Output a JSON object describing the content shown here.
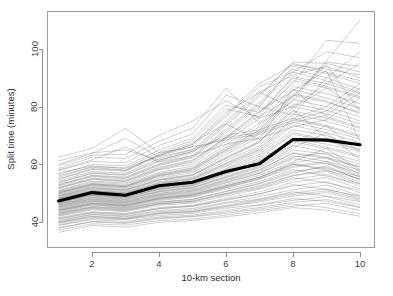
{
  "chart_data": {
    "type": "line",
    "title": "",
    "subtitle": "",
    "xlabel": "10-km section",
    "ylabel": "Split time (minutes)",
    "xlim": [
      1,
      10
    ],
    "ylim": [
      35,
      112
    ],
    "xticks": [
      2,
      4,
      6,
      8,
      10
    ],
    "xtick_labels": [
      "2",
      "4",
      "6",
      "8",
      "10"
    ],
    "yticks": [
      40,
      60,
      80,
      100
    ],
    "ytick_labels": [
      "40",
      "60",
      "80",
      "100"
    ],
    "grid": false,
    "legend": null,
    "legend_position": "none",
    "x": [
      1,
      2,
      3,
      4,
      5,
      6,
      7,
      8,
      9,
      10
    ],
    "series": [
      {
        "name": "mean-split-time",
        "style": "bold-black",
        "values": [
          47.3,
          50.2,
          49.3,
          52.6,
          53.8,
          57.5,
          60.2,
          68.6,
          68.4,
          66.8
        ]
      },
      {
        "name": "runner-1",
        "values": [
          38.1,
          40.0,
          39.5,
          41.1,
          41.8,
          43.0,
          44.5,
          46.2,
          45.0,
          42.8
        ]
      },
      {
        "name": "runner-2",
        "values": [
          39.0,
          41.2,
          40.8,
          42.3,
          43.0,
          44.8,
          46.0,
          48.1,
          47.2,
          45.0
        ]
      },
      {
        "name": "runner-3",
        "values": [
          36.4,
          38.8,
          38.2,
          39.9,
          40.5,
          41.8,
          43.2,
          45.0,
          44.1,
          42.0
        ]
      },
      {
        "name": "runner-4",
        "values": [
          40.2,
          42.5,
          41.8,
          43.6,
          44.2,
          46.5,
          48.0,
          50.5,
          49.0,
          47.1
        ]
      },
      {
        "name": "runner-5",
        "values": [
          41.0,
          43.1,
          42.5,
          44.6,
          45.5,
          47.8,
          49.6,
          53.0,
          51.2,
          49.0
        ]
      },
      {
        "name": "runner-6",
        "values": [
          42.3,
          44.5,
          43.9,
          46.2,
          47.0,
          49.5,
          51.8,
          55.4,
          53.6,
          51.0
        ]
      },
      {
        "name": "runner-7",
        "values": [
          43.5,
          45.8,
          45.0,
          47.5,
          48.6,
          51.4,
          54.0,
          58.2,
          56.0,
          53.2
        ]
      },
      {
        "name": "runner-8",
        "values": [
          44.1,
          46.4,
          45.7,
          48.3,
          49.5,
          52.6,
          55.5,
          60.1,
          58.0,
          55.0
        ]
      },
      {
        "name": "runner-9",
        "values": [
          45.0,
          47.2,
          46.5,
          49.1,
          50.2,
          53.5,
          56.8,
          62.0,
          60.2,
          57.1
        ]
      },
      {
        "name": "runner-10",
        "values": [
          45.8,
          48.0,
          47.3,
          50.0,
          51.3,
          54.8,
          58.2,
          64.0,
          62.5,
          59.2
        ]
      },
      {
        "name": "runner-11",
        "values": [
          46.3,
          48.7,
          48.0,
          50.8,
          52.1,
          55.9,
          59.6,
          66.5,
          64.2,
          61.0
        ]
      },
      {
        "name": "runner-12",
        "values": [
          46.9,
          49.3,
          48.6,
          51.5,
          52.9,
          57.0,
          61.1,
          68.5,
          66.0,
          63.0
        ]
      },
      {
        "name": "runner-13",
        "values": [
          47.4,
          49.9,
          49.2,
          52.2,
          53.6,
          58.2,
          62.8,
          71.0,
          68.5,
          65.2
        ]
      },
      {
        "name": "runner-14",
        "values": [
          47.9,
          50.4,
          49.7,
          52.9,
          54.4,
          59.3,
          64.2,
          73.5,
          71.0,
          67.5
        ]
      },
      {
        "name": "runner-15",
        "values": [
          48.4,
          51.0,
          50.3,
          53.6,
          55.2,
          60.5,
          65.8,
          76.0,
          73.4,
          70.0
        ]
      },
      {
        "name": "runner-16",
        "values": [
          48.9,
          51.6,
          50.9,
          54.4,
          56.1,
          61.9,
          67.5,
          78.5,
          76.0,
          72.5
        ]
      },
      {
        "name": "runner-17",
        "values": [
          49.5,
          52.3,
          51.6,
          55.3,
          57.1,
          63.4,
          69.5,
          81.0,
          78.8,
          75.0
        ]
      },
      {
        "name": "runner-18",
        "values": [
          50.1,
          53.0,
          52.3,
          56.2,
          58.2,
          65.0,
          71.8,
          84.0,
          81.5,
          78.0
        ]
      },
      {
        "name": "runner-19",
        "values": [
          50.8,
          53.8,
          53.1,
          57.2,
          59.4,
          66.8,
          74.2,
          87.0,
          84.5,
          81.0
        ]
      },
      {
        "name": "runner-20",
        "values": [
          51.6,
          54.7,
          54.0,
          58.3,
          60.8,
          68.8,
          77.0,
          90.5,
          88.0,
          84.5
        ]
      },
      {
        "name": "runner-21",
        "values": [
          52.5,
          55.7,
          55.0,
          59.6,
          62.3,
          71.0,
          80.0,
          94.0,
          91.5,
          88.0
        ]
      },
      {
        "name": "runner-22",
        "values": [
          53.5,
          56.8,
          56.2,
          61.0,
          64.0,
          73.5,
          83.5,
          95.5,
          95.0,
          92.0
        ]
      },
      {
        "name": "runner-23",
        "values": [
          54.8,
          58.2,
          57.6,
          62.8,
          66.2,
          76.5,
          87.0,
          92.0,
          99.0,
          97.0
        ]
      },
      {
        "name": "runner-24",
        "values": [
          56.5,
          60.0,
          59.5,
          65.0,
          69.0,
          80.5,
          78.0,
          88.0,
          103.0,
          102.0
        ]
      },
      {
        "name": "runner-25",
        "values": [
          58.5,
          62.5,
          62.0,
          68.0,
          72.5,
          86.5,
          74.0,
          82.0,
          96.0,
          110.0
        ]
      },
      {
        "name": "runner-26",
        "values": [
          61.2,
          64.0,
          65.0,
          61.5,
          64.5,
          70.0,
          72.0,
          76.0,
          80.0,
          88.0
        ]
      },
      {
        "name": "runner-27",
        "values": [
          62.5,
          65.5,
          72.5,
          64.0,
          66.0,
          68.5,
          70.5,
          74.5,
          77.0,
          85.0
        ]
      },
      {
        "name": "runner-28",
        "values": [
          57.0,
          59.5,
          58.5,
          63.0,
          67.0,
          78.0,
          85.0,
          79.5,
          86.5,
          79.0
        ]
      },
      {
        "name": "runner-29",
        "values": [
          55.5,
          59.0,
          58.0,
          63.5,
          67.5,
          74.0,
          68.5,
          86.0,
          76.5,
          73.0
        ]
      },
      {
        "name": "runner-30",
        "values": [
          52.0,
          55.2,
          54.5,
          59.0,
          61.5,
          69.5,
          78.5,
          85.5,
          92.5,
          68.0
        ]
      },
      {
        "name": "runner-31",
        "values": [
          49.2,
          52.0,
          51.2,
          54.8,
          56.5,
          62.5,
          68.0,
          79.0,
          69.0,
          66.5
        ]
      },
      {
        "name": "runner-32",
        "values": [
          46.6,
          49.0,
          48.3,
          51.2,
          52.5,
          56.5,
          60.3,
          67.0,
          73.5,
          64.0
        ]
      },
      {
        "name": "runner-33",
        "values": [
          44.8,
          47.0,
          46.2,
          48.8,
          49.9,
          53.0,
          56.2,
          61.0,
          65.5,
          58.0
        ]
      },
      {
        "name": "runner-34",
        "values": [
          43.0,
          45.2,
          44.6,
          46.8,
          47.8,
          50.5,
          53.2,
          57.0,
          59.5,
          54.5
        ]
      },
      {
        "name": "runner-35",
        "values": [
          41.5,
          43.6,
          43.0,
          45.0,
          45.8,
          48.2,
          50.5,
          53.8,
          55.5,
          51.5
        ]
      },
      {
        "name": "runner-36",
        "values": [
          40.0,
          42.0,
          41.4,
          43.2,
          43.8,
          45.8,
          47.8,
          50.0,
          51.5,
          48.5
        ]
      },
      {
        "name": "runner-37",
        "values": [
          38.8,
          40.8,
          40.2,
          41.8,
          42.4,
          44.0,
          45.8,
          47.5,
          48.8,
          46.0
        ]
      },
      {
        "name": "runner-38",
        "values": [
          37.2,
          39.4,
          38.9,
          40.5,
          41.0,
          42.4,
          43.9,
          45.5,
          46.5,
          44.0
        ]
      },
      {
        "name": "runner-39",
        "values": [
          47.0,
          49.5,
          48.8,
          51.8,
          53.2,
          57.2,
          61.5,
          69.0,
          67.0,
          64.5
        ]
      },
      {
        "name": "runner-40",
        "values": [
          48.1,
          50.7,
          50.0,
          53.2,
          54.8,
          59.8,
          64.8,
          74.5,
          72.0,
          68.8
        ]
      },
      {
        "name": "runner-41",
        "values": [
          45.4,
          47.6,
          46.9,
          49.5,
          50.8,
          54.2,
          57.5,
          63.0,
          61.0,
          58.0
        ]
      },
      {
        "name": "runner-42",
        "values": [
          50.5,
          53.4,
          52.7,
          56.8,
          58.8,
          65.9,
          73.0,
          86.0,
          83.0,
          79.5
        ]
      },
      {
        "name": "runner-43",
        "values": [
          42.8,
          45.0,
          44.3,
          46.5,
          47.4,
          50.0,
          52.6,
          56.2,
          58.0,
          53.8
        ]
      },
      {
        "name": "runner-44",
        "values": [
          51.0,
          54.2,
          53.5,
          58.0,
          60.2,
          68.0,
          76.0,
          89.0,
          86.5,
          83.0
        ]
      },
      {
        "name": "runner-45",
        "values": [
          44.5,
          46.7,
          46.0,
          48.5,
          49.6,
          52.5,
          55.6,
          60.5,
          62.5,
          56.5
        ]
      },
      {
        "name": "runner-46",
        "values": [
          53.0,
          56.2,
          55.6,
          60.2,
          63.0,
          72.2,
          81.5,
          93.0,
          90.0,
          86.0
        ]
      },
      {
        "name": "runner-47",
        "values": [
          46.0,
          48.3,
          47.6,
          50.4,
          51.7,
          55.3,
          58.8,
          65.0,
          63.5,
          60.0
        ]
      },
      {
        "name": "runner-48",
        "values": [
          49.8,
          52.6,
          51.9,
          55.8,
          57.6,
          64.2,
          70.5,
          82.5,
          80.0,
          76.5
        ]
      },
      {
        "name": "runner-49",
        "values": [
          43.8,
          46.0,
          45.3,
          47.8,
          48.9,
          51.8,
          54.8,
          59.0,
          60.5,
          55.5
        ]
      },
      {
        "name": "runner-50",
        "values": [
          54.2,
          57.5,
          56.9,
          62.0,
          65.0,
          75.0,
          85.0,
          91.0,
          94.0,
          90.0
        ]
      },
      {
        "name": "runner-51",
        "values": [
          39.5,
          41.6,
          41.0,
          42.8,
          43.4,
          45.2,
          47.0,
          49.0,
          50.2,
          47.5
        ]
      },
      {
        "name": "runner-52",
        "values": [
          59.5,
          63.2,
          63.5,
          70.0,
          75.0,
          82.0,
          76.0,
          80.0,
          88.0,
          95.0
        ]
      },
      {
        "name": "runner-53",
        "values": [
          57.8,
          61.0,
          60.5,
          66.5,
          70.5,
          84.0,
          80.0,
          77.0,
          90.0,
          99.0
        ]
      },
      {
        "name": "runner-54",
        "values": [
          60.0,
          63.8,
          69.0,
          62.5,
          65.2,
          69.2,
          71.2,
          75.2,
          78.5,
          86.5
        ]
      },
      {
        "name": "runner-55",
        "values": [
          47.6,
          50.1,
          49.4,
          52.4,
          53.9,
          58.6,
          63.5,
          72.0,
          70.0,
          66.0
        ]
      },
      {
        "name": "runner-56",
        "values": [
          45.6,
          47.9,
          47.1,
          49.8,
          51.0,
          54.5,
          58.0,
          63.8,
          62.0,
          59.0
        ]
      },
      {
        "name": "runner-57",
        "values": [
          42.0,
          44.2,
          43.6,
          45.8,
          46.6,
          49.0,
          51.4,
          54.8,
          56.5,
          52.5
        ]
      },
      {
        "name": "runner-58",
        "values": [
          50.3,
          53.2,
          52.5,
          56.5,
          58.5,
          65.5,
          72.0,
          84.5,
          82.0,
          77.5
        ]
      },
      {
        "name": "runner-59",
        "values": [
          48.7,
          51.3,
          50.6,
          54.0,
          55.6,
          61.2,
          66.5,
          77.5,
          75.0,
          71.5
        ]
      },
      {
        "name": "runner-60",
        "values": [
          44.0,
          46.2,
          45.5,
          48.0,
          49.1,
          52.0,
          55.0,
          59.5,
          61.0,
          56.0
        ]
      },
      {
        "name": "runner-61",
        "values": [
          52.8,
          56.0,
          55.3,
          59.9,
          62.6,
          71.6,
          80.8,
          92.0,
          89.0,
          85.0
        ]
      },
      {
        "name": "runner-62",
        "values": [
          46.8,
          49.2,
          48.5,
          51.4,
          52.7,
          56.8,
          60.8,
          67.8,
          65.5,
          62.5
        ]
      },
      {
        "name": "runner-63",
        "values": [
          41.2,
          43.3,
          42.7,
          44.7,
          45.4,
          47.5,
          49.8,
          52.5,
          54.0,
          50.2
        ]
      },
      {
        "name": "runner-64",
        "values": [
          55.0,
          58.5,
          57.9,
          63.2,
          66.8,
          77.2,
          88.0,
          94.5,
          93.0,
          91.0
        ]
      },
      {
        "name": "runner-65",
        "values": [
          49.0,
          51.8,
          51.1,
          54.6,
          56.3,
          62.2,
          67.8,
          80.0,
          77.5,
          74.0
        ]
      },
      {
        "name": "runner-66",
        "values": [
          43.2,
          45.4,
          44.8,
          47.0,
          47.9,
          50.7,
          53.5,
          57.5,
          59.0,
          54.8
        ]
      },
      {
        "name": "runner-67",
        "values": [
          51.8,
          54.9,
          54.2,
          58.6,
          61.2,
          69.2,
          78.0,
          90.0,
          87.0,
          83.5
        ]
      },
      {
        "name": "runner-68",
        "values": [
          47.2,
          49.7,
          49.0,
          52.0,
          53.4,
          57.8,
          62.0,
          70.5,
          68.0,
          65.0
        ]
      },
      {
        "name": "runner-69",
        "values": [
          40.6,
          42.7,
          42.1,
          44.0,
          44.7,
          46.8,
          48.8,
          51.2,
          52.8,
          49.2
        ]
      },
      {
        "name": "runner-70",
        "values": [
          56.0,
          59.2,
          58.8,
          64.2,
          68.2,
          79.2,
          76.5,
          83.5,
          95.5,
          94.0
        ]
      },
      {
        "name": "runner-71",
        "values": [
          48.2,
          50.8,
          50.1,
          53.4,
          55.0,
          60.2,
          65.2,
          75.5,
          73.0,
          69.5
        ]
      },
      {
        "name": "runner-72",
        "values": [
          45.2,
          47.4,
          46.7,
          49.3,
          50.5,
          53.8,
          57.0,
          62.5,
          64.0,
          57.5
        ]
      },
      {
        "name": "runner-73",
        "values": [
          42.5,
          44.8,
          44.1,
          46.3,
          47.2,
          49.8,
          52.2,
          56.0,
          57.5,
          53.2
        ]
      },
      {
        "name": "runner-74",
        "values": [
          53.8,
          57.0,
          56.5,
          61.4,
          64.5,
          74.2,
          84.2,
          95.0,
          92.0,
          89.0
        ]
      },
      {
        "name": "runner-75",
        "values": [
          46.2,
          48.5,
          47.8,
          50.6,
          51.9,
          55.6,
          59.2,
          65.8,
          71.0,
          61.5
        ]
      },
      {
        "name": "runner-76",
        "values": [
          39.8,
          41.9,
          41.2,
          43.0,
          43.6,
          45.5,
          47.4,
          49.5,
          50.8,
          48.0
        ]
      },
      {
        "name": "runner-77",
        "values": [
          50.0,
          52.9,
          52.2,
          56.0,
          58.0,
          64.8,
          71.0,
          83.5,
          94.5,
          78.5
        ]
      },
      {
        "name": "runner-78",
        "values": [
          44.3,
          46.5,
          45.8,
          48.2,
          49.3,
          52.2,
          55.3,
          60.0,
          58.5,
          55.8
        ]
      },
      {
        "name": "runner-79",
        "values": [
          58.0,
          61.5,
          66.0,
          60.8,
          63.0,
          67.0,
          69.0,
          73.0,
          75.5,
          83.0
        ]
      },
      {
        "name": "runner-80",
        "values": [
          37.8,
          40.2,
          39.8,
          41.4,
          42.0,
          43.5,
          45.0,
          46.8,
          47.8,
          45.2
        ]
      }
    ]
  }
}
